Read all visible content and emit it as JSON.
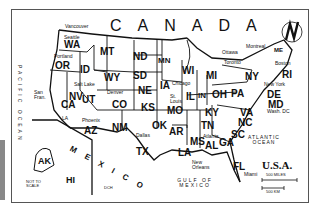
{
  "map": {
    "country_label": "U.S.A.",
    "neighbors": {
      "north": "CANADA",
      "south": "MEXICO"
    },
    "oceans": [
      "PACIFIC OCEAN",
      "ATLANTIC OCEAN",
      "GULF OF MEXICO"
    ],
    "states": [
      "WA",
      "OR",
      "CA",
      "NV",
      "ID",
      "MT",
      "WY",
      "UT",
      "AZ",
      "CO",
      "NM",
      "ND",
      "SD",
      "NE",
      "KS",
      "OK",
      "TX",
      "MN",
      "IA",
      "MO",
      "AR",
      "LA",
      "WI",
      "IL",
      "MI",
      "IN",
      "OH",
      "KY",
      "TN",
      "MS",
      "AL",
      "GA",
      "FL",
      "SC",
      "NC",
      "VA",
      "WV",
      "PA",
      "NY",
      "ME",
      "VT",
      "NH",
      "MA",
      "RI",
      "CT",
      "NJ",
      "DE",
      "MD",
      "AK",
      "HI"
    ],
    "cities": [
      "Vancouver",
      "Seattle",
      "Portland",
      "San Fran.",
      "Salt Lake",
      "Denver",
      "LA",
      "Phoenix",
      "Dallas",
      "St. Louis",
      "Chicago",
      "Atlanta",
      "New Orleans",
      "Miami",
      "Wash. DC",
      "New York",
      "Boston",
      "Ottawa",
      "Toronto",
      "Montreal"
    ],
    "inset_note": "NOT TO SCALE",
    "scale": {
      "miles": "500 MILES",
      "km": "500 KM"
    },
    "compass": "N",
    "misc": "DCH"
  }
}
